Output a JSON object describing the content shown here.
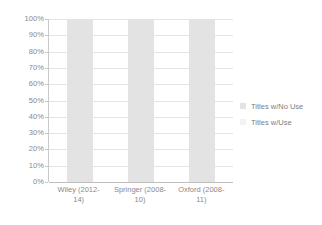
{
  "chart_data": {
    "type": "bar",
    "subtype": "stacked-100-percent",
    "title": "",
    "xlabel": "",
    "ylabel": "",
    "categories": [
      "Wiley (2012-14)",
      "Springer (2008-10)",
      "Oxford (2008-11)"
    ],
    "category_lines": [
      [
        "Wiley (2012-",
        "14)"
      ],
      [
        "Springer (2008-",
        "10)"
      ],
      [
        "Oxford (2008-",
        "11)"
      ]
    ],
    "series": [
      {
        "name": "Titles w/No Use",
        "values": [
          100,
          100,
          100
        ],
        "color": "#e3e3e3"
      },
      {
        "name": "Titles w/Use",
        "values": [
          0,
          0,
          0
        ],
        "color": "#f2f2f2"
      }
    ],
    "ylim": [
      0,
      100
    ],
    "y_ticks": [
      0,
      10,
      20,
      30,
      40,
      50,
      60,
      70,
      80,
      90,
      100
    ],
    "y_tick_labels": [
      "0%",
      "10%",
      "20%",
      "30%",
      "40%",
      "50%",
      "60%",
      "70%",
      "80%",
      "90%",
      "100%"
    ],
    "grid": true,
    "grid_axis": "y",
    "legend_position": "right"
  },
  "legend": {
    "items": [
      {
        "label": "Titles w/No Use",
        "color": "#e3e3e3"
      },
      {
        "label": "Titles w/Use",
        "color": "#f2f2f2"
      }
    ]
  },
  "colors": {
    "background": "#ffffff",
    "gridline": "#e4e4e4",
    "axis_line": "#c9c9c9",
    "baseline": "#bdbdbd",
    "text": "#808080",
    "bar_no_use": "#e3e3e3",
    "bar_use": "#f2f2f2"
  }
}
